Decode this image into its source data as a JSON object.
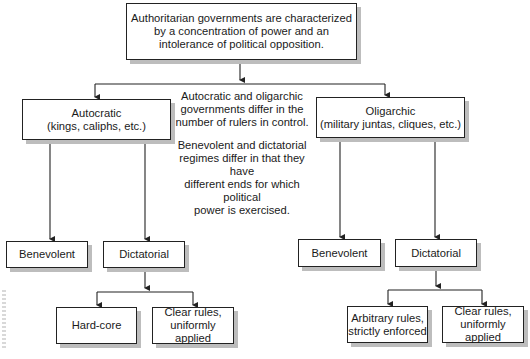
{
  "root": {
    "text": "Authoritarian governments are characterized by a concentration of power and an intolerance of political opposition.",
    "lines": [
      "Authoritarian governments are characterized",
      "by a concentration of power and an",
      "intolerance of political opposition."
    ]
  },
  "notes": {
    "rulers": [
      "Autocratic and oligarchic",
      "governments differ in the",
      "number of rulers in control."
    ],
    "ends": [
      "Benevolent and dictatorial",
      "regimes differ in that they have",
      "different ends for which political",
      "power is exercised."
    ]
  },
  "autocratic": {
    "title": "Autocratic",
    "subtitle": "(kings, caliphs, etc.)",
    "children": {
      "benevolent": "Benevolent",
      "dictatorial": {
        "label": "Dictatorial",
        "children": {
          "hardcore": "Hard-core",
          "clear_rules": [
            "Clear rules,",
            "uniformly applied"
          ]
        }
      }
    }
  },
  "oligarchic": {
    "title": "Oligarchic",
    "subtitle": "(military juntas, cliques, etc.)",
    "children": {
      "benevolent": "Benevolent",
      "dictatorial": {
        "label": "Dictatorial",
        "children": {
          "arbitrary": [
            "Arbitrary rules,",
            "strictly enforced"
          ],
          "clear_rules": [
            "Clear rules,",
            "uniformly applied"
          ]
        }
      }
    }
  },
  "colors": {
    "line": "#222222",
    "shadow": "#bdbdbd",
    "box_bg": "#ffffff"
  }
}
